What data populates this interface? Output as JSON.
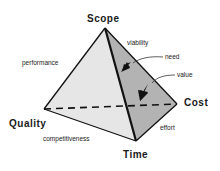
{
  "diagram": {
    "type": "tetrahedron",
    "vertices": {
      "scope": "Scope",
      "quality": "Quality",
      "time": "Time",
      "cost": "Cost"
    },
    "edge_labels": {
      "scope_quality": "performance",
      "scope_cost": "viability",
      "quality_time": "competitiveness",
      "time_cost": "effort"
    },
    "face_labels": {
      "need": "need",
      "value": "value"
    },
    "colors": {
      "front_face": "#e6e6e6",
      "right_face": "#b3b3b3",
      "line": "#111111"
    }
  }
}
